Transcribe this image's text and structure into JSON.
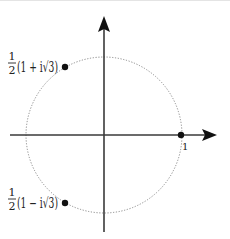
{
  "diagram": {
    "type": "complex-plane-unit-circle",
    "colors": {
      "axis": "#3a3a3a",
      "circle": "#8a8a8a",
      "point": "#111111",
      "text": "#222222"
    },
    "axes": {
      "horizontal": {
        "has_arrow": true
      },
      "vertical": {
        "has_arrow": true
      }
    },
    "circle": {
      "style": "dotted",
      "radius_label": ""
    },
    "points": [
      {
        "id": "upper",
        "label_fraction_num": "1",
        "label_fraction_den": "2",
        "label_expr": "(1 + i√3)"
      },
      {
        "id": "lower",
        "label_fraction_num": "1",
        "label_fraction_den": "2",
        "label_expr": "(1 − i√3)"
      },
      {
        "id": "one",
        "label": "1"
      }
    ]
  }
}
